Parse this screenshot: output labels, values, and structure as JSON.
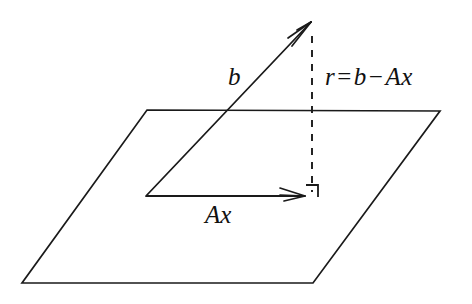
{
  "figure": {
    "kind": "least-squares-projection-diagram",
    "background_color": "#ffffff",
    "stroke_color": "#1a1a1a",
    "labels": {
      "b_vector": "b",
      "projection_vector": "Ax",
      "residual_prefix": "r",
      "residual_equals": "=",
      "residual_b": "b",
      "residual_minus": "−",
      "residual_ax": "Ax",
      "residual_full": "r = b − Ax"
    },
    "geometry": {
      "plane_corners": [
        {
          "x": 147,
          "y": 110
        },
        {
          "x": 440,
          "y": 111
        },
        {
          "x": 313,
          "y": 283
        },
        {
          "x": 22,
          "y": 283
        }
      ],
      "origin": {
        "x": 146,
        "y": 196
      },
      "b_tip": {
        "x": 311,
        "y": 22
      },
      "ax_tip": {
        "x": 305,
        "y": 196
      },
      "residual_dashed_top": {
        "x": 312,
        "y": 36
      },
      "residual_dashed_bottom": {
        "x": 312,
        "y": 192
      },
      "right_angle_marker": {
        "x": 306,
        "y": 185,
        "size": 12
      }
    }
  }
}
